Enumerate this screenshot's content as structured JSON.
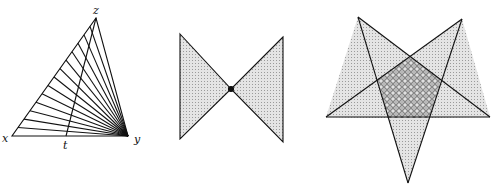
{
  "figures": {
    "triangle": {
      "labels": {
        "x": "x",
        "y": "y",
        "z": "z",
        "t": "t"
      },
      "vertices": {
        "x": [
          12,
          136
        ],
        "y": [
          128,
          136
        ],
        "z": [
          96,
          18
        ],
        "t": [
          66,
          136
        ]
      },
      "fan_lines": 14
    },
    "bowtie": {
      "left": [
        [
          180,
          34
        ],
        [
          231,
          89
        ],
        [
          180,
          139
        ]
      ],
      "right": [
        [
          283,
          37
        ],
        [
          231,
          89
        ],
        [
          283,
          142
        ]
      ],
      "center_point": [
        231,
        89
      ]
    },
    "star": {
      "outer": [
        [
          358,
          17
        ],
        [
          462,
          19
        ],
        [
          326,
          117
        ],
        [
          490,
          117
        ],
        [
          408,
          183
        ]
      ],
      "inner_pentagon": [
        [
          410,
          57
        ],
        [
          441,
          80
        ],
        [
          429,
          118
        ],
        [
          388,
          118
        ],
        [
          378,
          80
        ]
      ]
    }
  },
  "colors": {
    "stroke": "#111111",
    "fill_light": "#d6d6d6",
    "fill_dark": "#a8a8a8"
  }
}
